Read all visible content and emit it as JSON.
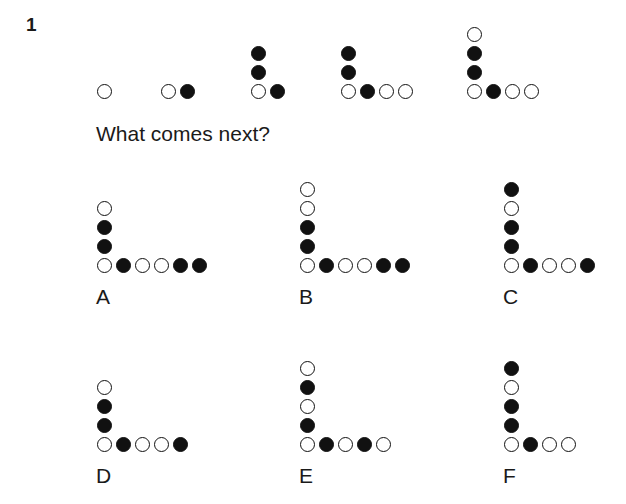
{
  "puzzle": {
    "number": "1",
    "prompt": "What comes next?",
    "colors": {
      "ink": "#111111",
      "background": "#ffffff"
    },
    "legend": {
      "open": "open circle",
      "filled": "filled circle"
    },
    "sequence": [
      {
        "id": "seq-1",
        "x": 96,
        "y": 102,
        "column": [],
        "row": [
          "open"
        ]
      },
      {
        "id": "seq-2",
        "x": 160,
        "y": 102,
        "column": [],
        "row": [
          "open",
          "filled"
        ]
      },
      {
        "id": "seq-3",
        "x": 250,
        "y": 102,
        "column": [
          "filled",
          "filled"
        ],
        "row": [
          "open",
          "filled"
        ]
      },
      {
        "id": "seq-4",
        "x": 340,
        "y": 102,
        "column": [
          "filled",
          "filled"
        ],
        "row": [
          "open",
          "filled",
          "open",
          "open"
        ]
      },
      {
        "id": "seq-5",
        "x": 466,
        "y": 102,
        "column": [
          "open",
          "filled",
          "filled"
        ],
        "row": [
          "open",
          "filled",
          "open",
          "open"
        ]
      }
    ],
    "options": [
      {
        "id": "option-a",
        "label": "A",
        "x": 96,
        "y": 276,
        "label_x": 96,
        "label_y": 286,
        "column": [
          "open",
          "filled",
          "filled"
        ],
        "row": [
          "open",
          "filled",
          "open",
          "open",
          "filled",
          "filled"
        ]
      },
      {
        "id": "option-b",
        "label": "B",
        "x": 299,
        "y": 276,
        "label_x": 299,
        "label_y": 286,
        "column": [
          "open",
          "open",
          "filled",
          "filled"
        ],
        "row": [
          "open",
          "filled",
          "open",
          "open",
          "filled",
          "filled"
        ]
      },
      {
        "id": "option-c",
        "label": "C",
        "x": 503,
        "y": 276,
        "label_x": 503,
        "label_y": 286,
        "column": [
          "filled",
          "open",
          "filled",
          "filled"
        ],
        "row": [
          "open",
          "filled",
          "open",
          "open",
          "filled"
        ]
      },
      {
        "id": "option-d",
        "label": "D",
        "x": 96,
        "y": 455,
        "label_x": 96,
        "label_y": 465,
        "column": [
          "open",
          "filled",
          "filled"
        ],
        "row": [
          "open",
          "filled",
          "open",
          "open",
          "filled"
        ]
      },
      {
        "id": "option-e",
        "label": "E",
        "x": 299,
        "y": 455,
        "label_x": 299,
        "label_y": 465,
        "column": [
          "open",
          "filled",
          "open",
          "filled"
        ],
        "row": [
          "open",
          "filled",
          "open",
          "filled",
          "open"
        ]
      },
      {
        "id": "option-f",
        "label": "F",
        "x": 503,
        "y": 455,
        "label_x": 503,
        "label_y": 465,
        "column": [
          "filled",
          "open",
          "filled",
          "filled"
        ],
        "row": [
          "open",
          "filled",
          "open",
          "open"
        ]
      }
    ]
  }
}
